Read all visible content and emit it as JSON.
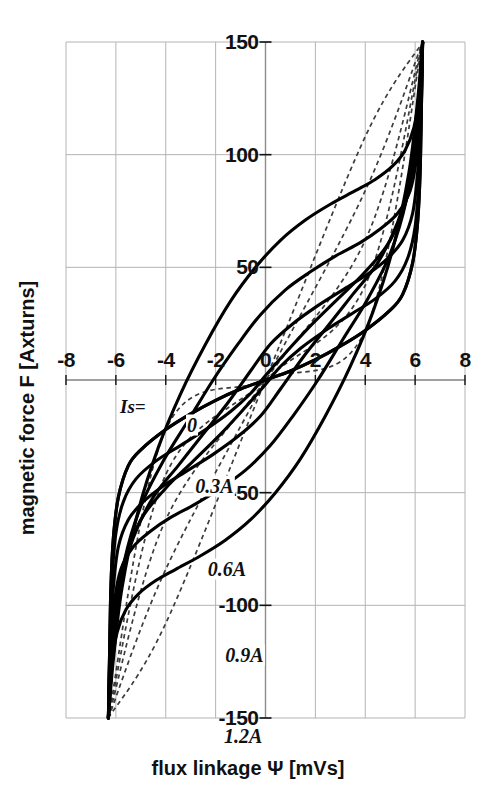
{
  "figure": {
    "kind": "hysteresis-characteristic-plot",
    "background_color": "#ffffff",
    "ink_color": "#111111",
    "grid_color": "#b4b4b4"
  },
  "axes": {
    "x": {
      "title": "flux linkage  Ψ   [mVs]",
      "unit": "mVs",
      "symbol": "Ψ",
      "name": "flux linkage",
      "min": -8,
      "max": 8,
      "ticks": [
        -8,
        -6,
        -4,
        -2,
        0,
        2,
        4,
        6,
        8
      ],
      "tick_labels": [
        "-8",
        "-6",
        "-4",
        "-2",
        "0",
        "2",
        "4",
        "6",
        "8"
      ]
    },
    "y": {
      "title": "magnetic force  F  [Axturns]",
      "unit": "Axturns",
      "symbol": "F",
      "name": "magnetic force",
      "min": -150,
      "max": 150,
      "ticks": [
        150,
        100,
        50,
        -50,
        -100,
        -150
      ],
      "tick_labels": [
        "150",
        "100",
        "50",
        "-50",
        "-100",
        "-150"
      ]
    },
    "grid": "on",
    "grid_x_step": 2,
    "grid_y_step": 50
  },
  "legend": {
    "key_label": "Is=",
    "position": "inside-lower-left",
    "entries": [
      {
        "label": "0",
        "current_A": 0.0
      },
      {
        "label": "0.3A",
        "current_A": 0.3
      },
      {
        "label": "0.6A",
        "current_A": 0.6
      },
      {
        "label": "0.9A",
        "current_A": 0.9
      },
      {
        "label": "1.2A",
        "current_A": 1.2
      }
    ]
  },
  "chart_data": {
    "type": "line",
    "title": "",
    "xlabel": "flux linkage  Ψ   [mVs]",
    "ylabel": "magnetic force  F  [Axturns]",
    "xlim": [
      -8,
      8
    ],
    "ylim": [
      -150,
      150
    ],
    "grid": true,
    "legend_position": "inside-lower-left",
    "legend_title": "Is=",
    "x_ticks": [
      -8,
      -6,
      -4,
      -2,
      0,
      2,
      4,
      6,
      8
    ],
    "y_ticks": [
      150,
      100,
      50,
      -50,
      -100,
      -150
    ],
    "series": [
      {
        "name": "0",
        "current_A": 0.0,
        "style": "solid",
        "color": "#000000",
        "role": "hysteresis-loop",
        "coercive_flux": 0.15,
        "remanent_force": 12,
        "saturation_flux": 6.2,
        "saturation_force": 150,
        "upper_branch": [
          [
            -6.3,
            -150
          ],
          [
            -6.25,
            -120
          ],
          [
            -6.2,
            -92
          ],
          [
            -6.1,
            -70
          ],
          [
            -5.9,
            -52
          ],
          [
            -5.5,
            -38
          ],
          [
            -5.0,
            -31
          ],
          [
            -4.0,
            -22
          ],
          [
            -3.0,
            -15
          ],
          [
            -2.0,
            -9
          ],
          [
            -1.0,
            -4
          ],
          [
            0.0,
            0
          ],
          [
            1.0,
            4
          ],
          [
            2.0,
            9
          ],
          [
            3.0,
            15
          ],
          [
            4.0,
            22
          ],
          [
            5.0,
            31
          ],
          [
            5.5,
            38
          ],
          [
            5.9,
            52
          ],
          [
            6.1,
            70
          ],
          [
            6.2,
            92
          ],
          [
            6.25,
            120
          ],
          [
            6.3,
            150
          ]
        ],
        "lower_branch": [
          [
            6.3,
            150
          ],
          [
            6.25,
            120
          ],
          [
            6.2,
            92
          ],
          [
            6.1,
            70
          ],
          [
            5.9,
            52
          ],
          [
            5.5,
            38
          ],
          [
            5.0,
            31
          ],
          [
            4.0,
            22
          ],
          [
            3.0,
            15
          ],
          [
            2.0,
            9
          ],
          [
            1.0,
            4
          ],
          [
            0.0,
            0
          ],
          [
            -1.0,
            -4
          ],
          [
            -2.0,
            -9
          ],
          [
            -3.0,
            -15
          ],
          [
            -4.0,
            -22
          ],
          [
            -5.0,
            -31
          ],
          [
            -5.5,
            -38
          ],
          [
            -5.9,
            -52
          ],
          [
            -6.1,
            -70
          ],
          [
            -6.2,
            -92
          ],
          [
            -6.25,
            -120
          ],
          [
            -6.3,
            -150
          ]
        ],
        "mean_line": [
          [
            -6.3,
            -150
          ],
          [
            -4.0,
            -22
          ],
          [
            0.0,
            0
          ],
          [
            4.0,
            22
          ],
          [
            6.3,
            150
          ]
        ]
      },
      {
        "name": "0.3A",
        "current_A": 0.3,
        "style": "solid",
        "color": "#000000",
        "role": "hysteresis-loop",
        "coercive_flux": 1.05,
        "remanent_force": 30,
        "saturation_flux": 6.2,
        "saturation_force": 150,
        "upper_branch": [
          [
            -6.3,
            -150
          ],
          [
            -6.24,
            -118
          ],
          [
            -6.16,
            -90
          ],
          [
            -6.0,
            -68
          ],
          [
            -5.7,
            -54
          ],
          [
            -5.2,
            -44
          ],
          [
            -4.4,
            -36
          ],
          [
            -3.4,
            -29
          ],
          [
            -2.4,
            -22
          ],
          [
            -1.4,
            -14
          ],
          [
            -0.6,
            -6
          ],
          [
            0.0,
            2
          ],
          [
            0.8,
            12
          ],
          [
            1.8,
            24
          ],
          [
            2.9,
            36
          ],
          [
            4.0,
            48
          ],
          [
            5.0,
            62
          ],
          [
            5.7,
            82
          ],
          [
            6.05,
            106
          ],
          [
            6.2,
            128
          ],
          [
            6.3,
            150
          ]
        ],
        "lower_branch": [
          [
            6.3,
            150
          ],
          [
            6.24,
            118
          ],
          [
            6.16,
            90
          ],
          [
            6.0,
            68
          ],
          [
            5.7,
            54
          ],
          [
            5.2,
            44
          ],
          [
            4.4,
            36
          ],
          [
            3.4,
            29
          ],
          [
            2.4,
            22
          ],
          [
            1.4,
            14
          ],
          [
            0.6,
            6
          ],
          [
            0.0,
            -2
          ],
          [
            -0.8,
            -12
          ],
          [
            -1.8,
            -24
          ],
          [
            -2.9,
            -36
          ],
          [
            -4.0,
            -48
          ],
          [
            -5.0,
            -62
          ],
          [
            -5.7,
            -82
          ],
          [
            -6.05,
            -106
          ],
          [
            -6.2,
            -128
          ],
          [
            -6.3,
            -150
          ]
        ],
        "mean_line": [
          [
            -6.3,
            -150
          ],
          [
            -4.0,
            -42
          ],
          [
            0.0,
            0
          ],
          [
            4.0,
            42
          ],
          [
            6.3,
            150
          ]
        ]
      },
      {
        "name": "0.6A",
        "current_A": 0.6,
        "style": "solid",
        "color": "#000000",
        "role": "hysteresis-loop",
        "coercive_flux": 2.0,
        "remanent_force": 52,
        "saturation_flux": 6.2,
        "saturation_force": 150,
        "upper_branch": [
          [
            -6.3,
            -150
          ],
          [
            -6.22,
            -116
          ],
          [
            -6.1,
            -92
          ],
          [
            -5.9,
            -74
          ],
          [
            -5.5,
            -62
          ],
          [
            -4.9,
            -54
          ],
          [
            -4.1,
            -47
          ],
          [
            -3.1,
            -40
          ],
          [
            -2.1,
            -33
          ],
          [
            -1.1,
            -25
          ],
          [
            -0.2,
            -16
          ],
          [
            0.6,
            -4
          ],
          [
            1.5,
            10
          ],
          [
            2.5,
            24
          ],
          [
            3.5,
            38
          ],
          [
            4.5,
            52
          ],
          [
            5.3,
            70
          ],
          [
            5.85,
            92
          ],
          [
            6.12,
            116
          ],
          [
            6.3,
            150
          ]
        ],
        "lower_branch": [
          [
            6.3,
            150
          ],
          [
            6.22,
            116
          ],
          [
            6.1,
            92
          ],
          [
            5.9,
            74
          ],
          [
            5.5,
            62
          ],
          [
            4.9,
            54
          ],
          [
            4.1,
            47
          ],
          [
            3.1,
            40
          ],
          [
            2.1,
            33
          ],
          [
            1.1,
            25
          ],
          [
            0.2,
            16
          ],
          [
            -0.6,
            4
          ],
          [
            -1.5,
            -10
          ],
          [
            -2.5,
            -24
          ],
          [
            -3.5,
            -38
          ],
          [
            -4.5,
            -52
          ],
          [
            -5.3,
            -70
          ],
          [
            -5.85,
            -92
          ],
          [
            -6.12,
            -116
          ],
          [
            -6.3,
            -150
          ]
        ],
        "mean_line": [
          [
            -6.3,
            -150
          ],
          [
            -4.0,
            -62
          ],
          [
            0.0,
            0
          ],
          [
            4.0,
            62
          ],
          [
            6.3,
            150
          ]
        ]
      },
      {
        "name": "0.9A",
        "current_A": 0.9,
        "style": "solid",
        "color": "#000000",
        "role": "hysteresis-loop",
        "coercive_flux": 2.9,
        "remanent_force": 76,
        "saturation_flux": 6.2,
        "saturation_force": 150,
        "upper_branch": [
          [
            -6.3,
            -150
          ],
          [
            -6.2,
            -118
          ],
          [
            -6.05,
            -98
          ],
          [
            -5.8,
            -84
          ],
          [
            -5.3,
            -74
          ],
          [
            -4.6,
            -67
          ],
          [
            -3.8,
            -61
          ],
          [
            -2.8,
            -55
          ],
          [
            -1.8,
            -48
          ],
          [
            -0.8,
            -40
          ],
          [
            0.2,
            -29
          ],
          [
            1.1,
            -16
          ],
          [
            2.1,
            0
          ],
          [
            3.1,
            18
          ],
          [
            4.1,
            36
          ],
          [
            5.0,
            56
          ],
          [
            5.65,
            80
          ],
          [
            6.05,
            110
          ],
          [
            6.3,
            150
          ]
        ],
        "lower_branch": [
          [
            6.3,
            150
          ],
          [
            6.2,
            118
          ],
          [
            6.05,
            98
          ],
          [
            5.8,
            84
          ],
          [
            5.3,
            74
          ],
          [
            4.6,
            67
          ],
          [
            3.8,
            61
          ],
          [
            2.8,
            55
          ],
          [
            1.8,
            48
          ],
          [
            0.8,
            40
          ],
          [
            -0.2,
            29
          ],
          [
            -1.1,
            16
          ],
          [
            -2.1,
            0
          ],
          [
            -3.1,
            -18
          ],
          [
            -4.1,
            -36
          ],
          [
            -5.0,
            -56
          ],
          [
            -5.65,
            -80
          ],
          [
            -6.05,
            -110
          ],
          [
            -6.3,
            -150
          ]
        ],
        "mean_line": [
          [
            -6.3,
            -150
          ],
          [
            -4.0,
            -84
          ],
          [
            0.0,
            0
          ],
          [
            4.0,
            84
          ],
          [
            6.3,
            150
          ]
        ]
      },
      {
        "name": "1.2A",
        "current_A": 1.2,
        "style": "solid",
        "color": "#000000",
        "role": "hysteresis-loop",
        "coercive_flux": 3.8,
        "remanent_force": 100,
        "saturation_flux": 6.2,
        "saturation_force": 150,
        "upper_branch": [
          [
            -6.3,
            -150
          ],
          [
            -6.15,
            -126
          ],
          [
            -5.95,
            -112
          ],
          [
            -5.6,
            -102
          ],
          [
            -5.1,
            -95
          ],
          [
            -4.4,
            -89
          ],
          [
            -3.6,
            -84
          ],
          [
            -2.6,
            -78
          ],
          [
            -1.6,
            -71
          ],
          [
            -0.6,
            -62
          ],
          [
            0.4,
            -50
          ],
          [
            1.4,
            -35
          ],
          [
            2.4,
            -16
          ],
          [
            3.4,
            6
          ],
          [
            4.3,
            30
          ],
          [
            5.1,
            58
          ],
          [
            5.75,
            92
          ],
          [
            6.1,
            124
          ],
          [
            6.3,
            150
          ]
        ],
        "lower_branch": [
          [
            6.3,
            150
          ],
          [
            6.15,
            126
          ],
          [
            5.95,
            112
          ],
          [
            5.6,
            102
          ],
          [
            5.1,
            95
          ],
          [
            4.4,
            89
          ],
          [
            3.6,
            84
          ],
          [
            2.6,
            78
          ],
          [
            1.6,
            71
          ],
          [
            0.6,
            62
          ],
          [
            -0.4,
            50
          ],
          [
            -1.4,
            35
          ],
          [
            -2.4,
            16
          ],
          [
            -3.4,
            -6
          ],
          [
            -4.3,
            -30
          ],
          [
            -5.1,
            -58
          ],
          [
            -5.75,
            -92
          ],
          [
            -6.1,
            -124
          ],
          [
            -6.3,
            -150
          ]
        ],
        "mean_line": [
          [
            -6.3,
            -150
          ],
          [
            -4.0,
            -108
          ],
          [
            0.0,
            0
          ],
          [
            4.0,
            108
          ],
          [
            6.3,
            150
          ]
        ]
      }
    ]
  }
}
